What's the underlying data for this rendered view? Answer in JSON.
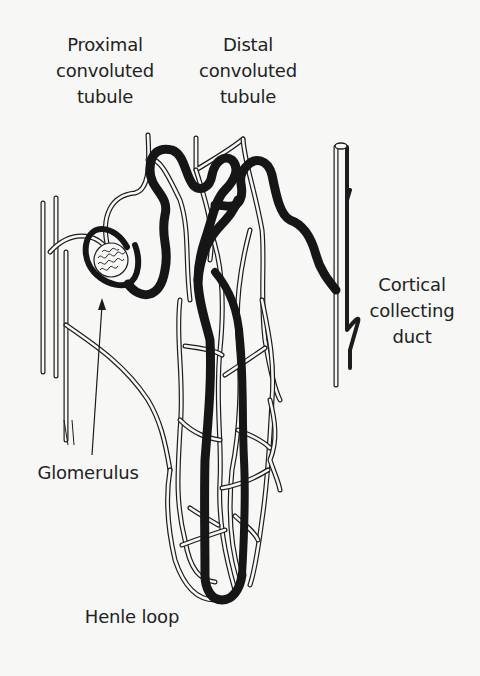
{
  "diagram": {
    "background_color": "#f7f7f6",
    "ink_color": "#161616",
    "labels": {
      "proximal": [
        "Proximal",
        "convoluted",
        "tubule"
      ],
      "distal": [
        "Distal",
        "convoluted",
        "tubule"
      ],
      "cortical": [
        "Cortical",
        "collecting",
        "duct"
      ],
      "glomerulus": "Glomerulus",
      "henle": "Henle loop"
    },
    "parts": [
      {
        "name": "Proximal convoluted tubule",
        "style": "thick black tube"
      },
      {
        "name": "Distal convoluted tubule",
        "style": "thick black tube"
      },
      {
        "name": "Glomerulus",
        "style": "capillary tuft in Bowman's capsule"
      },
      {
        "name": "Henle loop",
        "style": "U-shaped black loop"
      },
      {
        "name": "Cortical collecting duct",
        "style": "double-line tube"
      },
      {
        "name": "Peritubular capillaries",
        "style": "double-line vessels"
      }
    ]
  }
}
